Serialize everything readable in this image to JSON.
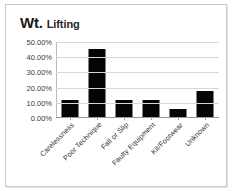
{
  "title": {
    "main": "Wt.",
    "sub": "Lifting"
  },
  "colors": {
    "bar": "#050505",
    "gridline": "#d7d7d7",
    "axis": "#9a9a9a",
    "frame": "#c9c9c9",
    "text": "#333333",
    "background": "#ffffff"
  },
  "chart_data": {
    "type": "bar",
    "title": "Wt. Lifting",
    "xlabel": "",
    "ylabel": "",
    "categories": [
      "Carelessness",
      "Poor Technique",
      "Fall or Slip",
      "Faulty Equipment",
      "Kit/Footwear",
      "Unknown"
    ],
    "values": [
      11.0,
      44.5,
      11.0,
      11.0,
      5.5,
      17.0
    ],
    "value_labels": [
      "11.00%",
      "44.50%",
      "11.00%",
      "11.00%",
      "5.50%",
      "17.00%"
    ],
    "ylim": [
      0,
      50
    ],
    "ytick_values": [
      0,
      10,
      20,
      30,
      40,
      50
    ],
    "ytick_labels": [
      "0.00%",
      "10.00%",
      "20.00%",
      "30.00%",
      "40.00%",
      "50.00%"
    ],
    "grid": true,
    "legend": false,
    "legend_position": "none",
    "series": [
      {
        "name": "Wt. Lifting",
        "values": [
          11.0,
          44.5,
          11.0,
          11.0,
          5.5,
          17.0
        ]
      }
    ],
    "xtick_label_rotation": -45,
    "annotations": []
  }
}
